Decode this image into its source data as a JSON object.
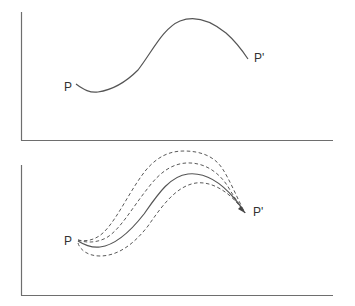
{
  "figure": {
    "type": "path-diagram",
    "panels": [
      {
        "id": "top",
        "description": "Single trajectory from P to P'",
        "start_label": "P",
        "end_label": "P'",
        "paths": [
          {
            "style": "solid",
            "role": "trajectory"
          }
        ]
      },
      {
        "id": "bottom",
        "description": "Bundle of alternative trajectories from P converging at P'",
        "start_label": "P",
        "end_label": "P'",
        "paths": [
          {
            "style": "solid",
            "role": "central-trajectory"
          },
          {
            "style": "dashed",
            "role": "alternative-trajectory-upper-outer"
          },
          {
            "style": "dashed",
            "role": "alternative-trajectory-upper-inner"
          },
          {
            "style": "dashed",
            "role": "alternative-trajectory-lower"
          }
        ]
      }
    ]
  },
  "labels": {
    "top_start": "P",
    "top_end": "P'",
    "bottom_start": "P",
    "bottom_end": "P'"
  },
  "colors": {
    "axis": "#6e6e6e",
    "curve": "#555555",
    "text": "#333333",
    "background": "#ffffff"
  }
}
